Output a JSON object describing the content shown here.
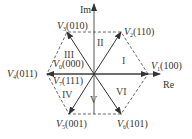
{
  "diagram": {
    "axes": {
      "real_label": "Re",
      "imag_label": "Im"
    },
    "vectors": [
      {
        "id": "V1",
        "name": "V",
        "sub": "1",
        "code": "(100)"
      },
      {
        "id": "V2",
        "name": "V",
        "sub": "2",
        "code": "(110)"
      },
      {
        "id": "V3",
        "name": "V",
        "sub": "3",
        "code": "(010)"
      },
      {
        "id": "V4",
        "name": "V",
        "sub": "4",
        "code": "(011)"
      },
      {
        "id": "V5",
        "name": "V",
        "sub": "5",
        "code": "(001)"
      },
      {
        "id": "V6",
        "name": "V",
        "sub": "6",
        "code": "(101)"
      },
      {
        "id": "V0",
        "name": "V",
        "sub": "0",
        "code": "(000)"
      },
      {
        "id": "V7",
        "name": "V",
        "sub": "7",
        "code": "(111)"
      }
    ],
    "sectors": [
      "I",
      "II",
      "III",
      "IV",
      "V",
      "VI"
    ],
    "colors": {
      "line": "#444444",
      "dashed": "#555555",
      "text": "#333333",
      "background": "#ffffff"
    }
  }
}
